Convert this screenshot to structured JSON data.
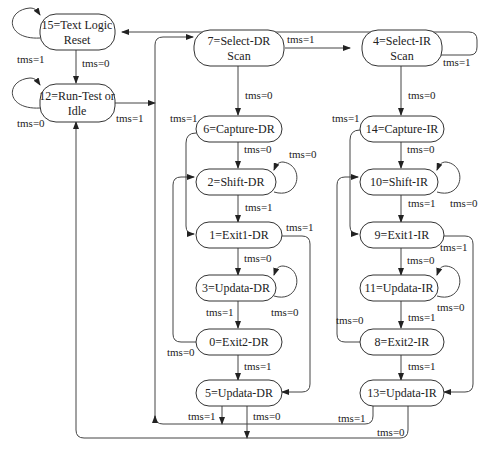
{
  "diagram": {
    "type": "state-machine",
    "states": [
      {
        "id": 15,
        "line1": "15=Text Logic",
        "line2": "Reset"
      },
      {
        "id": 12,
        "line1": "12=Run-Test or",
        "line2": "Idle"
      },
      {
        "id": 7,
        "line1": "7=Select-DR",
        "line2": "Scan"
      },
      {
        "id": 6,
        "line1": "6=Capture-DR",
        "line2": ""
      },
      {
        "id": 2,
        "line1": "2=Shift-DR",
        "line2": ""
      },
      {
        "id": 1,
        "line1": "1=Exit1-DR",
        "line2": ""
      },
      {
        "id": 3,
        "line1": "3=Updata-DR",
        "line2": ""
      },
      {
        "id": 0,
        "line1": "0=Exit2-DR",
        "line2": ""
      },
      {
        "id": 5,
        "line1": "5=Updata-DR",
        "line2": ""
      },
      {
        "id": 4,
        "line1": "4=Select-IR",
        "line2": "Scan"
      },
      {
        "id": 14,
        "line1": "14=Capture-IR",
        "line2": ""
      },
      {
        "id": 10,
        "line1": "10=Shift-IR",
        "line2": ""
      },
      {
        "id": 9,
        "line1": "9=Exit1-IR",
        "line2": ""
      },
      {
        "id": 11,
        "line1": "11=Updata-IR",
        "line2": ""
      },
      {
        "id": 8,
        "line1": "8=Exit2-IR",
        "line2": ""
      },
      {
        "id": 13,
        "line1": "13=Updata-IR",
        "line2": ""
      }
    ],
    "labels": {
      "s15_self": "tms=1",
      "s15_to_12": "tms=0",
      "s12_self": "tms=0",
      "s12_to_7": "tms=1",
      "s7_to_4": "tms=1",
      "s4_to_15": "tms=1",
      "s7_to_6": "tms=0",
      "s6_to_1": "tms=1",
      "s6_to_2": "tms=0",
      "s2_self": "tms=0",
      "s2_to_1": "tms=1",
      "s1_to_5": "tms=1",
      "s1_to_3": "tms=0",
      "s3_to_0": "tms=1",
      "s3_self": "tms=0",
      "s0_to_2": "tms=0",
      "s0_to_5": "tms=1",
      "s5_to_7": "tms=1",
      "s5_to_12": "tms=0",
      "s4_to_14": "tms=0",
      "s14_to_9": "tms=1",
      "s14_to_10": "tms=0",
      "s10_to_9": "tms=1",
      "s10_self": "tms=0",
      "s9_to_13": "tms=1",
      "s9_to_11": "tms=0",
      "s11_to_8": "tms=1",
      "s11_self": "tms=0",
      "s8_to_10": "tms=0",
      "s8_to_13": "tms=1",
      "s13_to_7": "tms=1",
      "s13_to_12": "tms=0"
    }
  }
}
